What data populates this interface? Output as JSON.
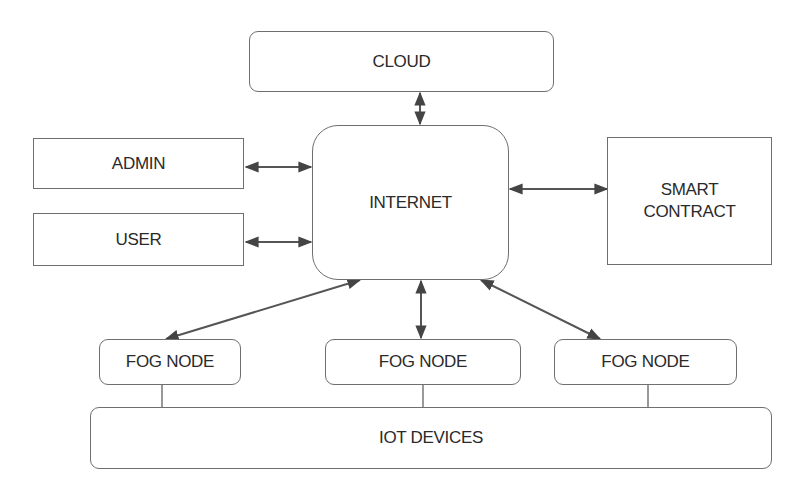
{
  "diagram": {
    "nodes": {
      "cloud": {
        "label": "CLOUD"
      },
      "admin": {
        "label": "ADMIN"
      },
      "user": {
        "label": "USER"
      },
      "internet": {
        "label": "INTERNET"
      },
      "smart_contract": {
        "label_line1": "SMART",
        "label_line2": "CONTRACT"
      },
      "fog_node_1": {
        "label": "FOG NODE"
      },
      "fog_node_2": {
        "label": "FOG NODE"
      },
      "fog_node_3": {
        "label": "FOG NODE"
      },
      "iot_devices": {
        "label": "IOT DEVICES"
      }
    },
    "edges": [
      {
        "from": "cloud",
        "to": "internet",
        "type": "bidirectional-arrow"
      },
      {
        "from": "admin",
        "to": "internet",
        "type": "bidirectional-arrow"
      },
      {
        "from": "user",
        "to": "internet",
        "type": "bidirectional-arrow"
      },
      {
        "from": "internet",
        "to": "smart_contract",
        "type": "bidirectional-arrow"
      },
      {
        "from": "internet",
        "to": "fog_node_1",
        "type": "bidirectional-arrow"
      },
      {
        "from": "internet",
        "to": "fog_node_2",
        "type": "bidirectional-arrow"
      },
      {
        "from": "internet",
        "to": "fog_node_3",
        "type": "bidirectional-arrow"
      },
      {
        "from": "fog_node_1",
        "to": "iot_devices",
        "type": "line"
      },
      {
        "from": "fog_node_2",
        "to": "iot_devices",
        "type": "line"
      },
      {
        "from": "fog_node_3",
        "to": "iot_devices",
        "type": "line"
      }
    ],
    "colors": {
      "stroke": "#6f6f6f",
      "arrow": "#444444",
      "text": "#2a2a2a",
      "background": "#ffffff"
    }
  }
}
